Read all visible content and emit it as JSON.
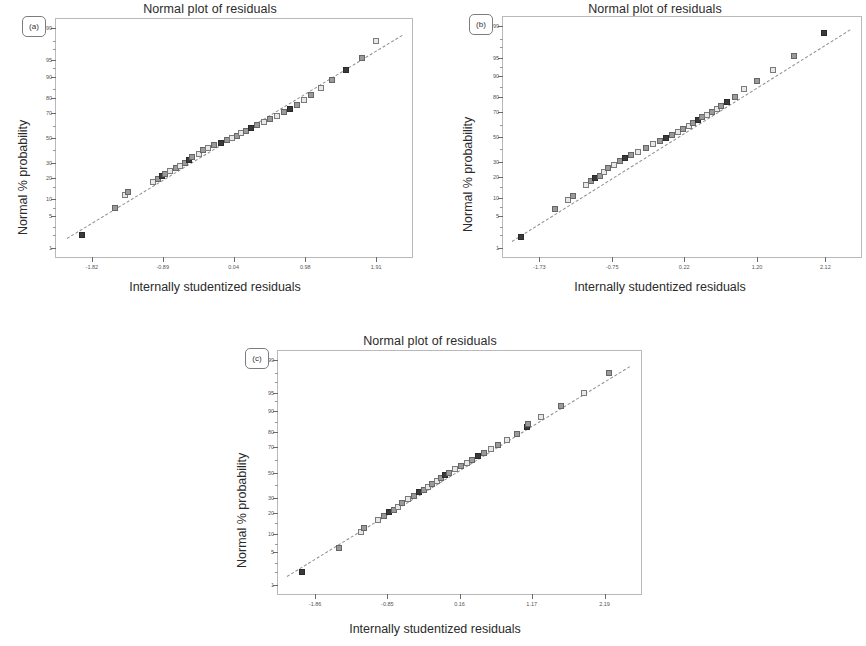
{
  "figure": {
    "panels": [
      {
        "tag": "(a)",
        "title": "Normal plot of residuals",
        "xlabel": "Internally studentized residuals",
        "ylabel": "Normal % probability"
      },
      {
        "tag": "(b)",
        "title": "Normal plot of residuals",
        "xlabel": "Internally studentized residuals",
        "ylabel": "Normal % probability"
      },
      {
        "tag": "(c)",
        "title": "Normal plot of residuals",
        "xlabel": "Internally studentized residuals",
        "ylabel": "Normal % probability"
      }
    ]
  },
  "chart_data": [
    {
      "type": "scatter",
      "panel": "(a)",
      "title": "Normal plot of residuals",
      "xlabel": "Internally studentized residuals",
      "ylabel": "Normal % probability",
      "grid": false,
      "legend": null,
      "xlim": [
        -2.29,
        2.38
      ],
      "xticks": [
        -1.82,
        -0.89,
        0.04,
        0.98,
        1.91
      ],
      "xtick_labels": [
        "-1.82",
        "-0.89",
        "0.04",
        "0.98",
        "1.91"
      ],
      "ytick_labels": [
        "99",
        "95",
        "90",
        "80",
        "70",
        "50",
        "30",
        "20",
        "10",
        "5",
        "1"
      ],
      "ytick_values": [
        99,
        95,
        90,
        80,
        70,
        50,
        30,
        20,
        10,
        5,
        1
      ],
      "yscale": "normal-probability",
      "reference_line": {
        "style": "dashed",
        "from": [
          -2.15,
          1.7
        ],
        "to": [
          2.25,
          98.5
        ]
      },
      "x": [
        -1.95,
        -1.52,
        -1.38,
        -1.35,
        -1.02,
        -0.95,
        -0.9,
        -0.86,
        -0.8,
        -0.72,
        -0.66,
        -0.6,
        -0.55,
        -0.5,
        -0.42,
        -0.36,
        -0.3,
        -0.22,
        -0.13,
        -0.05,
        0.02,
        0.08,
        0.14,
        0.2,
        0.27,
        0.35,
        0.44,
        0.52,
        0.61,
        0.7,
        0.78,
        0.87,
        0.96,
        1.06,
        1.18,
        1.33,
        1.52,
        1.72,
        1.91
      ],
      "y": [
        2.0,
        7.0,
        11.5,
        12.8,
        17.5,
        19.5,
        21.0,
        22.5,
        24.0,
        26.0,
        28.0,
        30.0,
        32.0,
        34.5,
        37.0,
        40.0,
        42.0,
        44.0,
        46.0,
        48.0,
        50.0,
        52.0,
        54.0,
        56.0,
        58.0,
        60.5,
        63.0,
        65.5,
        68.0,
        70.5,
        73.0,
        76.0,
        79.0,
        82.0,
        85.5,
        89.0,
        92.5,
        95.5,
        98.0
      ]
    },
    {
      "type": "scatter",
      "panel": "(b)",
      "title": "Normal plot of residuals",
      "xlabel": "Internally studentized residuals",
      "ylabel": "Normal % probability",
      "grid": false,
      "legend": null,
      "xlim": [
        -2.22,
        2.6
      ],
      "xticks": [
        -1.73,
        -0.75,
        0.22,
        1.2,
        2.12
      ],
      "xtick_labels": [
        "-1.73",
        "-0.75",
        "0.22",
        "1.20",
        "2.12"
      ],
      "ytick_labels": [
        "99",
        "95",
        "90",
        "80",
        "70",
        "50",
        "30",
        "20",
        "10",
        "5",
        "1"
      ],
      "ytick_values": [
        99,
        95,
        90,
        80,
        70,
        50,
        30,
        20,
        10,
        5,
        1
      ],
      "yscale": "normal-probability",
      "reference_line": {
        "style": "dashed",
        "from": [
          -2.1,
          1.5
        ],
        "to": [
          2.45,
          98.8
        ]
      },
      "x": [
        -1.98,
        -1.52,
        -1.35,
        -1.28,
        -1.1,
        -1.04,
        -0.98,
        -0.92,
        -0.86,
        -0.8,
        -0.72,
        -0.65,
        -0.58,
        -0.5,
        -0.4,
        -0.3,
        -0.2,
        -0.1,
        -0.02,
        0.06,
        0.14,
        0.21,
        0.28,
        0.34,
        0.4,
        0.46,
        0.53,
        0.6,
        0.66,
        0.72,
        0.8,
        0.9,
        1.02,
        1.2,
        1.42,
        1.7,
        2.1
      ],
      "y": [
        1.8,
        6.5,
        9.5,
        11.0,
        16.0,
        18.0,
        19.5,
        21.0,
        23.0,
        25.5,
        28.0,
        30.5,
        33.0,
        35.0,
        38.0,
        41.0,
        44.0,
        47.0,
        49.5,
        52.0,
        54.5,
        57.0,
        59.0,
        61.5,
        64.0,
        66.0,
        68.0,
        70.0,
        72.0,
        74.0,
        77.0,
        80.0,
        84.0,
        88.0,
        92.0,
        95.5,
        98.5
      ]
    },
    {
      "type": "scatter",
      "panel": "(c)",
      "title": "Normal plot of residuals",
      "xlabel": "Internally studentized residuals",
      "ylabel": "Normal % probability",
      "grid": false,
      "legend": null,
      "xlim": [
        -2.38,
        2.7
      ],
      "xticks": [
        -1.86,
        -0.85,
        0.16,
        1.17,
        2.19
      ],
      "xtick_labels": [
        "-1.86",
        "-0.85",
        "0.16",
        "1.17",
        "2.19"
      ],
      "ytick_labels": [
        "99",
        "95",
        "90",
        "80",
        "70",
        "50",
        "30",
        "20",
        "10",
        "5",
        "1"
      ],
      "ytick_values": [
        99,
        95,
        90,
        80,
        70,
        50,
        30,
        20,
        10,
        5,
        1
      ],
      "yscale": "normal-probability",
      "reference_line": {
        "style": "dashed",
        "from": [
          -2.25,
          1.6
        ],
        "to": [
          2.55,
          98.6
        ]
      },
      "x": [
        -2.05,
        -1.52,
        -1.22,
        -1.18,
        -0.98,
        -0.9,
        -0.82,
        -0.76,
        -0.7,
        -0.64,
        -0.56,
        -0.48,
        -0.4,
        -0.34,
        -0.28,
        -0.22,
        -0.16,
        -0.1,
        -0.04,
        0.02,
        0.1,
        0.18,
        0.26,
        0.34,
        0.42,
        0.5,
        0.6,
        0.7,
        0.82,
        0.96,
        1.1,
        1.12,
        1.3,
        1.58,
        1.9,
        2.25
      ],
      "y": [
        2.0,
        6.0,
        11.0,
        12.5,
        16.5,
        18.5,
        20.5,
        22.0,
        24.0,
        26.5,
        29.0,
        31.5,
        34.0,
        36.0,
        38.0,
        40.5,
        43.0,
        45.5,
        48.0,
        50.0,
        53.0,
        55.5,
        58.0,
        60.5,
        63.0,
        65.5,
        68.5,
        71.5,
        75.0,
        78.5,
        82.5,
        84.0,
        87.5,
        91.5,
        95.0,
        98.0
      ]
    }
  ]
}
